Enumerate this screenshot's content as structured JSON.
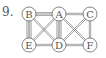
{
  "problem_number": "9.",
  "nodes": [
    {
      "id": "B",
      "x": 29,
      "y": 14
    },
    {
      "id": "A",
      "x": 59,
      "y": 14
    },
    {
      "id": "C",
      "x": 90,
      "y": 14
    },
    {
      "id": "E",
      "x": 29,
      "y": 45
    },
    {
      "id": "D",
      "x": 59,
      "y": 45
    },
    {
      "id": "F",
      "x": 90,
      "y": 45
    }
  ],
  "edges": [
    {
      "from": "B",
      "to": "A",
      "count": 3
    },
    {
      "from": "A",
      "to": "C",
      "count": 2
    },
    {
      "from": "B",
      "to": "E",
      "count": 4
    },
    {
      "from": "A",
      "to": "D",
      "count": 4
    },
    {
      "from": "C",
      "to": "F",
      "count": 2
    },
    {
      "from": "E",
      "to": "D",
      "count": 2
    },
    {
      "from": "D",
      "to": "F",
      "count": 2
    },
    {
      "from": "B",
      "to": "D",
      "count": 2
    },
    {
      "from": "E",
      "to": "A",
      "count": 2
    },
    {
      "from": "A",
      "to": "F",
      "count": 2
    },
    {
      "from": "D",
      "to": "C",
      "count": 2
    }
  ],
  "colors": {
    "stroke": "#666666",
    "fill": "#ffffff",
    "text": "#555555"
  }
}
